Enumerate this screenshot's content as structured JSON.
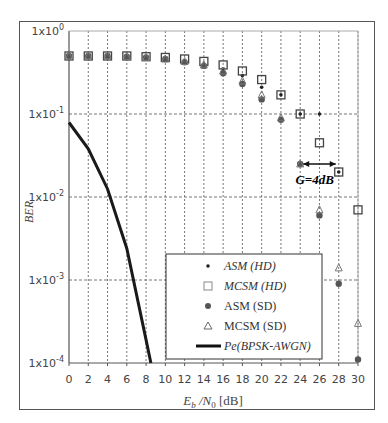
{
  "chart_data": {
    "type": "scatter",
    "title": "",
    "xlabel": "E_b/N_0 [dB]",
    "ylabel": "BER",
    "xlim": [
      0,
      30
    ],
    "ylim": [
      0.0001,
      1
    ],
    "yscale": "log",
    "grid": true,
    "legend_position": "lower right (inside)",
    "x_ticks": [
      "0",
      "2",
      "4",
      "6",
      "8",
      "10",
      "12",
      "14",
      "16",
      "18",
      "20",
      "22",
      "24",
      "26",
      "28",
      "30"
    ],
    "y_ticks": [
      "1x10^0",
      "1x10^-1",
      "1x10^-2",
      "1x10^-3",
      "1x10^-4"
    ],
    "annotation": "G=4dB",
    "series": [
      {
        "name": "ASM (HD)",
        "marker": "small dot",
        "x": [
          0,
          2,
          4,
          6,
          8,
          10,
          12,
          14,
          16,
          18,
          20,
          22,
          24,
          26,
          28
        ],
        "y": [
          0.5,
          0.5,
          0.49,
          0.48,
          0.47,
          0.46,
          0.43,
          0.4,
          0.35,
          0.29,
          0.21,
          0.17,
          0.1,
          0.1,
          0.02
        ]
      },
      {
        "name": "MCSM (HD)",
        "marker": "open square",
        "x": [
          0,
          2,
          4,
          6,
          8,
          10,
          12,
          14,
          16,
          18,
          20,
          22,
          24,
          26,
          28,
          30
        ],
        "y": [
          0.5,
          0.5,
          0.5,
          0.5,
          0.49,
          0.48,
          0.46,
          0.43,
          0.39,
          0.33,
          0.26,
          0.17,
          0.1,
          0.045,
          0.02,
          0.007
        ]
      },
      {
        "name": "ASM (SD)",
        "marker": "filled circle",
        "x": [
          0,
          2,
          4,
          6,
          8,
          10,
          12,
          14,
          16,
          18,
          20,
          22,
          24,
          26,
          28,
          30
        ],
        "y": [
          0.5,
          0.5,
          0.5,
          0.49,
          0.48,
          0.46,
          0.42,
          0.38,
          0.31,
          0.23,
          0.15,
          0.085,
          0.025,
          0.006,
          0.0009,
          0.00011
        ]
      },
      {
        "name": "MCSM (SD)",
        "marker": "open triangle",
        "x": [
          0,
          2,
          4,
          6,
          8,
          10,
          12,
          14,
          16,
          18,
          20,
          22,
          24,
          26,
          28,
          30
        ],
        "y": [
          0.5,
          0.5,
          0.5,
          0.49,
          0.48,
          0.46,
          0.43,
          0.39,
          0.33,
          0.25,
          0.17,
          0.09,
          0.025,
          0.007,
          0.0014,
          0.0003
        ]
      },
      {
        "name": "Pe(BPSK-AWGN)",
        "marker": "line",
        "x": [
          0,
          2,
          4,
          6,
          8,
          8.5
        ],
        "y": [
          0.079,
          0.038,
          0.0125,
          0.0024,
          0.00019,
          0.0001
        ]
      }
    ]
  },
  "legend": {
    "items": [
      "ASM (HD)",
      "MCSM (HD)",
      "ASM (SD)",
      "MCSM (SD)",
      "Pe(BPSK-AWGN)"
    ]
  },
  "axes": {
    "ylabel": "BER",
    "xlabel_main": "E",
    "xlabel_sub1": "b",
    "xlabel_mid": " /N",
    "xlabel_sub2": "0",
    "xlabel_unit": " [dB]"
  },
  "annotation": "G=4dB"
}
